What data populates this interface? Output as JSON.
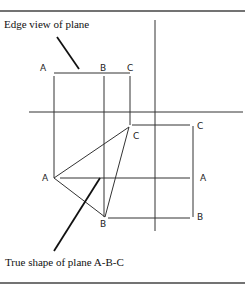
{
  "captions": {
    "edge_view": "Edge view of plane",
    "true_shape": "True shape of plane A-B-C"
  },
  "point_labels": {
    "top_A": "A",
    "top_B": "B",
    "top_C": "C",
    "tri_A": "A",
    "tri_B": "B",
    "tri_C": "C",
    "right_C": "C",
    "right_A": "A",
    "right_B": "B"
  }
}
